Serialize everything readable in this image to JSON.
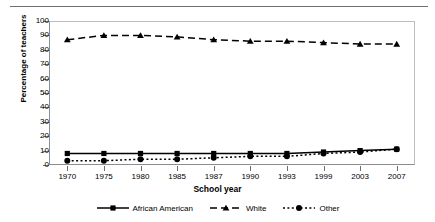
{
  "chart_data": {
    "type": "line",
    "title": "",
    "xlabel": "School year",
    "ylabel": "Percentage of teachers",
    "categories": [
      "1970",
      "1975",
      "1980",
      "1985",
      "1987",
      "1990",
      "1993",
      "1999",
      "2003",
      "2007"
    ],
    "ylim": [
      0,
      100
    ],
    "yticks": [
      0,
      10,
      20,
      30,
      40,
      50,
      60,
      70,
      80,
      90,
      100
    ],
    "grid": false,
    "legend_position": "bottom",
    "series": [
      {
        "name": "African American",
        "marker": "square",
        "linestyle": "solid",
        "color": "#000000",
        "values": [
          8,
          8,
          8,
          8,
          8,
          8,
          8,
          9,
          10,
          11
        ]
      },
      {
        "name": "White",
        "marker": "triangle",
        "linestyle": "dashed",
        "color": "#000000",
        "values": [
          87,
          90,
          90,
          89,
          87,
          86,
          86,
          85,
          84,
          84
        ]
      },
      {
        "name": "Other",
        "marker": "circle",
        "linestyle": "dotted",
        "color": "#000000",
        "values": [
          3,
          3,
          4,
          4,
          5,
          6,
          6,
          8,
          9,
          11
        ]
      }
    ]
  },
  "axis": {
    "ylabel_text": "Percentage of teachers",
    "xlabel_text": "School year",
    "ytick_labels": [
      "100",
      "90",
      "80",
      "70",
      "60",
      "50",
      "40",
      "30",
      "20",
      "10",
      "0"
    ],
    "xtick_labels": [
      "1970",
      "1975",
      "1980",
      "1985",
      "1987",
      "1990",
      "1993",
      "1999",
      "2003",
      "2007"
    ]
  },
  "legend": {
    "items": [
      {
        "label": "African American",
        "key": "solid-square-key"
      },
      {
        "label": "White",
        "key": "dashed-triangle-key"
      },
      {
        "label": "Other",
        "key": "dotted-circle-key"
      }
    ]
  }
}
